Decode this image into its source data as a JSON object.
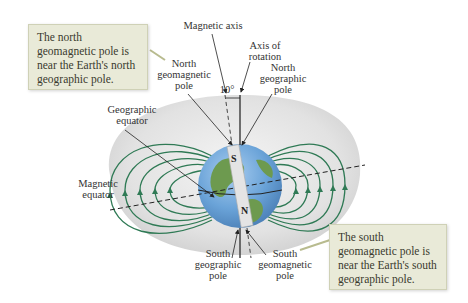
{
  "figure": {
    "callouts": {
      "north": "The north geomagnetic pole is near the Earth's north geographic pole.",
      "south": "The south geomagnetic pole is near the Earth's south geographic pole."
    },
    "labels": {
      "magnetic_axis": "Magnetic axis",
      "axis_of_rotation": "Axis of\nrotation",
      "north_geomagnetic_pole": "North\ngeomagnetic\npole",
      "north_geographic_pole": "North\ngeographic\npole",
      "angle": "10°",
      "geographic_equator": "Geographic\nequator",
      "magnetic_equator": "Magnetic\nequator",
      "south_geographic_pole": "South\ngeographic\npole",
      "south_geomagnetic_pole": "South\ngeomagnetic\npole",
      "magnet_south": "S",
      "magnet_north": "N"
    },
    "colors": {
      "field_line": "#2f7a55",
      "callout_bg": "#e9ead8",
      "ocean": "#6aa3d8",
      "land": "#6d9a4f",
      "halo": "#d9d9d9"
    }
  }
}
